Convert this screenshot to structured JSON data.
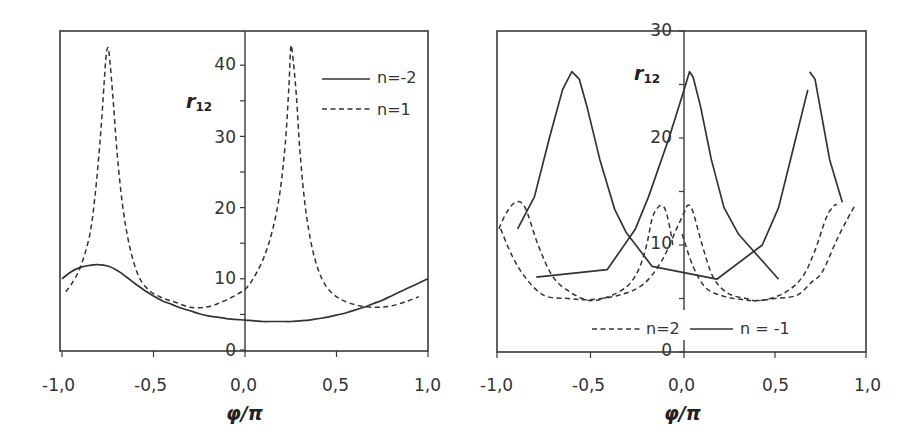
{
  "chart_data": [
    {
      "type": "line",
      "title": "",
      "xlabel": "φ/π",
      "ylabel": "r12",
      "xlim": [
        -1.0,
        1.0
      ],
      "ylim": [
        0,
        45
      ],
      "xticks": [
        "-1,0",
        "-0,5",
        "0,0",
        "0,5",
        "1,0"
      ],
      "yticks": [
        "0",
        "10",
        "20",
        "30",
        "40"
      ],
      "grid": false,
      "legend_position": "upper right",
      "series": [
        {
          "name": "n=-2",
          "style": "solid",
          "x": [
            -1.0,
            -0.95,
            -0.9,
            -0.85,
            -0.8,
            -0.75,
            -0.7,
            -0.65,
            -0.6,
            -0.55,
            -0.5,
            -0.45,
            -0.4,
            -0.35,
            -0.3,
            -0.25,
            -0.2,
            -0.15,
            -0.1,
            -0.05,
            0.0,
            0.05,
            0.1,
            0.15,
            0.2,
            0.25,
            0.3,
            0.35,
            0.4,
            0.45,
            0.5,
            0.55,
            0.6,
            0.65,
            0.7,
            0.75,
            0.8,
            0.85,
            0.9,
            0.95,
            1.0
          ],
          "values": [
            10.0,
            11.0,
            11.6,
            11.9,
            12.0,
            11.8,
            11.2,
            10.3,
            9.3,
            8.4,
            7.6,
            6.9,
            6.4,
            5.9,
            5.5,
            5.1,
            4.8,
            4.6,
            4.4,
            4.3,
            4.2,
            4.1,
            4.0,
            4.0,
            4.0,
            4.0,
            4.1,
            4.2,
            4.4,
            4.6,
            4.9,
            5.2,
            5.6,
            6.0,
            6.5,
            7.0,
            7.6,
            8.2,
            8.8,
            9.4,
            10.0
          ]
        },
        {
          "name": "n=1",
          "style": "dashed",
          "x": [
            -0.98,
            -0.95,
            -0.9,
            -0.85,
            -0.82,
            -0.79,
            -0.77,
            -0.76,
            -0.75,
            -0.74,
            -0.72,
            -0.7,
            -0.67,
            -0.63,
            -0.58,
            -0.52,
            -0.45,
            -0.38,
            -0.3,
            -0.22,
            -0.15,
            -0.08,
            -0.03,
            0.0,
            0.04,
            0.1,
            0.15,
            0.19,
            0.22,
            0.24,
            0.25,
            0.26,
            0.28,
            0.3,
            0.33,
            0.37,
            0.42,
            0.48,
            0.55,
            0.63,
            0.72,
            0.8,
            0.88,
            0.95
          ],
          "values": [
            8.2,
            9.2,
            11.6,
            16.0,
            21.5,
            30.0,
            37.5,
            41.0,
            42.5,
            41.0,
            35.0,
            28.0,
            20.5,
            14.5,
            10.3,
            8.3,
            7.3,
            6.7,
            6.0,
            6.0,
            6.5,
            7.3,
            8.0,
            8.5,
            9.8,
            12.8,
            16.8,
            22.0,
            29.0,
            37.0,
            42.5,
            41.5,
            36.0,
            28.0,
            20.0,
            14.0,
            10.0,
            7.9,
            6.8,
            6.2,
            6.0,
            6.2,
            6.8,
            7.5
          ]
        }
      ]
    },
    {
      "type": "line",
      "title": "",
      "xlabel": "φ/π",
      "ylabel": "r12",
      "xlim": [
        -1.0,
        1.0
      ],
      "ylim": [
        0,
        30
      ],
      "xticks": [
        "-1,0",
        "-0,5",
        "0,0",
        "0,5",
        "1,0"
      ],
      "yticks": [
        "0",
        "10",
        "20",
        "30"
      ],
      "grid": false,
      "legend_position": "lower center",
      "series": [
        {
          "name": "n=2",
          "style": "dashed",
          "segments": [
            {
              "x": [
                -0.99,
                -0.95,
                -0.9,
                -0.85,
                -0.78,
                -0.7,
                -0.6,
                -0.5,
                -0.4,
                -0.3,
                -0.24,
                -0.2,
                -0.17,
                -0.14,
                -0.12,
                -0.1,
                -0.08,
                -0.06
              ],
              "values": [
                11.5,
                13.0,
                14.0,
                13.5,
                10.0,
                7.0,
                5.5,
                4.8,
                5.2,
                6.2,
                7.8,
                10.0,
                12.5,
                13.5,
                13.7,
                13.3,
                12.0,
                10.0
              ]
            },
            {
              "x": [
                -0.98,
                -0.92,
                -0.85,
                -0.75,
                -0.62,
                -0.5,
                -0.35,
                -0.22,
                -0.12,
                -0.04,
                0.0,
                0.02,
                0.04,
                0.06,
                0.1,
                0.16,
                0.24,
                0.34,
                0.42,
                0.55,
                0.65,
                0.72,
                0.78,
                0.82,
                0.84
              ],
              "values": [
                11.5,
                9.0,
                7.0,
                5.3,
                5.0,
                4.9,
                5.3,
                6.3,
                8.5,
                11.5,
                13.0,
                13.7,
                13.5,
                12.5,
                10.0,
                7.0,
                5.5,
                5.0,
                4.8,
                5.5,
                7.0,
                9.5,
                12.5,
                13.6,
                13.8
              ]
            },
            {
              "x": [
                -0.01,
                0.05,
                0.12,
                0.22,
                0.32,
                0.4,
                0.5,
                0.62,
                0.7,
                0.76,
                0.84,
                0.9,
                0.94
              ],
              "values": [
                11.0,
                8.0,
                6.0,
                5.2,
                4.9,
                4.8,
                5.0,
                5.3,
                6.5,
                7.5,
                10.5,
                12.5,
                13.7
              ]
            }
          ]
        },
        {
          "name": "n = -1",
          "style": "solid",
          "segments": [
            {
              "x": [
                -0.89,
                -0.8,
                -0.72,
                -0.65,
                -0.6,
                -0.56,
                -0.52,
                -0.45,
                -0.37,
                -0.31,
                -0.17,
                0.18,
                0.43,
                0.52,
                0.6,
                0.68
              ],
              "values": [
                11.5,
                14.5,
                20.0,
                24.5,
                26.2,
                25.5,
                23.0,
                18.0,
                13.3,
                11.2,
                8.0,
                6.8,
                10.0,
                13.5,
                19.0,
                24.5
              ]
            },
            {
              "x": [
                0.69,
                0.72,
                0.8,
                0.87
              ],
              "values": [
                26.2,
                25.5,
                18.0,
                14.0
              ]
            },
            {
              "x": [
                -0.79,
                -0.41,
                -0.26,
                -0.19,
                -0.08,
                0.0,
                0.03,
                0.05,
                0.09,
                0.15,
                0.22,
                0.3,
                0.52
              ],
              "values": [
                7.0,
                7.7,
                11.5,
                14.5,
                20.0,
                24.5,
                26.2,
                25.7,
                23.0,
                18.0,
                13.5,
                11.0,
                6.8
              ]
            }
          ]
        }
      ]
    }
  ],
  "left": {
    "ylabel": "r",
    "ylabel_sub": "12",
    "xlabel": "φ/π",
    "xticks": [
      "-1,0",
      "-0,5",
      "0,0",
      "0,5",
      "1,0"
    ],
    "yticks": [
      "0",
      "10",
      "20",
      "30",
      "40"
    ],
    "legend": [
      {
        "label": "n=-2",
        "style": "solid"
      },
      {
        "label": "n=1",
        "style": "dashed"
      }
    ]
  },
  "right": {
    "ylabel": "r",
    "ylabel_sub": "12",
    "xlabel": "φ/π",
    "xticks": [
      "-1,0",
      "-0,5",
      "0,0",
      "0,5",
      "1,0"
    ],
    "yticks": [
      "0",
      "10",
      "20",
      "30"
    ],
    "legend": [
      {
        "label": "n=2",
        "style": "dashed"
      },
      {
        "label": "n = -1",
        "style": "solid"
      }
    ]
  }
}
